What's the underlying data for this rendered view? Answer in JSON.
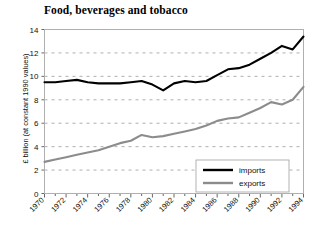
{
  "chart_data": {
    "type": "line",
    "title": "Food, beverages and tobacco",
    "xlabel": "",
    "ylabel": "£ billion (at constant 1990 values)",
    "xlim": [
      1970,
      1994
    ],
    "ylim": [
      0,
      14
    ],
    "yticks": [
      "0",
      "2",
      "4",
      "6",
      "8",
      "10",
      "12",
      "14"
    ],
    "xticks": [
      "1970",
      "1972",
      "1974",
      "1976",
      "1978",
      "1980",
      "1982",
      "1984",
      "1986",
      "1988",
      "1990",
      "1992",
      "1994"
    ],
    "grid": "horizontal-dashed",
    "legend_position": "lower-right",
    "x": [
      1970,
      1971,
      1972,
      1973,
      1974,
      1975,
      1976,
      1977,
      1978,
      1979,
      1980,
      1981,
      1982,
      1983,
      1984,
      1985,
      1986,
      1987,
      1988,
      1989,
      1990,
      1991,
      1992,
      1993,
      1994
    ],
    "series": [
      {
        "name": "imports",
        "color": "#000000",
        "values": [
          9.5,
          9.5,
          9.6,
          9.7,
          9.5,
          9.4,
          9.4,
          9.4,
          9.5,
          9.6,
          9.3,
          8.8,
          9.4,
          9.6,
          9.5,
          9.6,
          10.1,
          10.6,
          10.7,
          11.0,
          11.5,
          12.0,
          12.6,
          12.3,
          13.4
        ]
      },
      {
        "name": "exports",
        "color": "#8c8c8c",
        "values": [
          2.7,
          2.9,
          3.1,
          3.3,
          3.5,
          3.7,
          4.0,
          4.3,
          4.5,
          5.0,
          4.8,
          4.9,
          5.1,
          5.3,
          5.5,
          5.8,
          6.2,
          6.4,
          6.5,
          6.9,
          7.3,
          7.8,
          7.6,
          8.0,
          9.1
        ]
      }
    ]
  },
  "legend": {
    "items": [
      {
        "label": "imports"
      },
      {
        "label": "exports"
      }
    ]
  }
}
